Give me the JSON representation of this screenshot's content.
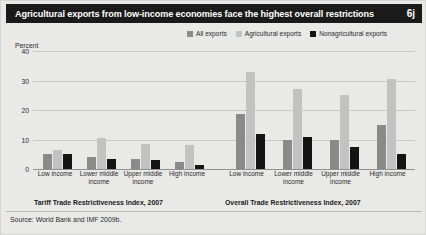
{
  "header": {
    "title": "Agricultural exports from low-income economies face the highest overall restrictions",
    "badge": "6j"
  },
  "legend": [
    {
      "label": "All exports",
      "color": "#8a8a8a",
      "key": "all"
    },
    {
      "label": "Agricultural exports",
      "color": "#c2c2c2",
      "key": "agri"
    },
    {
      "label": "Nonagricultural exports",
      "color": "#141414",
      "key": "nonagri"
    }
  ],
  "axis": {
    "unit_label": "Percent",
    "ticks": [
      "40",
      "30",
      "20",
      "10",
      "0"
    ]
  },
  "panels": [
    {
      "caption": "Tariff Trade Restrictiveness Index, 2007"
    },
    {
      "caption": "Overall Trade Restrictiveness Index, 2007"
    }
  ],
  "source": "Source: World Bank and IMF 2009b.",
  "chart_data": {
    "type": "bar",
    "title": "Agricultural exports from low-income economies face the highest overall restrictions",
    "xlabel": "",
    "ylabel": "Percent",
    "ylim": [
      0,
      40
    ],
    "yticks": [
      0,
      10,
      20,
      30,
      40
    ],
    "grid": true,
    "legend_position": "top-right",
    "categories": [
      "Low income",
      "Lower middle income",
      "Upper middle income",
      "High income"
    ],
    "panels": [
      {
        "name": "Tariff Trade Restrictiveness Index, 2007",
        "series": [
          {
            "name": "All exports",
            "values": [
              5.0,
              4.0,
              3.5,
              2.5
            ]
          },
          {
            "name": "Agricultural exports",
            "values": [
              6.5,
              10.5,
              8.5,
              8.0
            ]
          },
          {
            "name": "Nonagricultural exports",
            "values": [
              5.0,
              3.5,
              3.0,
              1.5
            ]
          }
        ]
      },
      {
        "name": "Overall Trade Restrictiveness Index, 2007",
        "series": [
          {
            "name": "All exports",
            "values": [
              18.5,
              10.0,
              10.0,
              15.0
            ]
          },
          {
            "name": "Agricultural exports",
            "values": [
              33.0,
              27.0,
              25.0,
              30.5
            ]
          },
          {
            "name": "Nonagricultural exports",
            "values": [
              12.0,
              11.0,
              7.5,
              5.0
            ]
          }
        ]
      }
    ]
  }
}
